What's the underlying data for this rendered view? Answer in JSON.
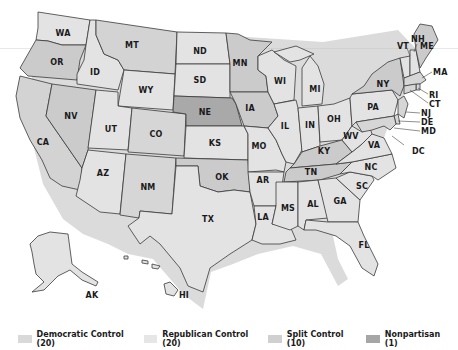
{
  "colors": {
    "democratic": "#d6d6d6",
    "republican": "#e3e3e3",
    "split": "#cfcfcf",
    "nonpartisan": "#a9a9a9",
    "dark_state": "#c4c4c4",
    "border": "#3a3a3a"
  },
  "legend": [
    {
      "label": "Democratic Control (20)",
      "color": "#d9d9d9"
    },
    {
      "label": "Republican Control (20)",
      "color": "#e6e6e6"
    },
    {
      "label": "Split Control (10)",
      "color": "#d0d0d0"
    },
    {
      "label": "Nonpartisan (1)",
      "color": "#a6a6a6"
    }
  ],
  "states": {
    "WA": "WA",
    "OR": "OR",
    "CA": "CA",
    "ID": "ID",
    "NV": "NV",
    "MT": "MT",
    "WY": "WY",
    "UT": "UT",
    "AZ": "AZ",
    "CO": "CO",
    "NM": "NM",
    "ND": "ND",
    "SD": "SD",
    "NE": "NE",
    "KS": "KS",
    "OK": "OK",
    "TX": "TX",
    "MN": "MN",
    "IA": "IA",
    "MO": "MO",
    "AR": "AR",
    "LA": "LA",
    "WI": "WI",
    "IL": "IL",
    "MI": "MI",
    "IN": "IN",
    "OH": "OH",
    "KY": "KY",
    "TN": "TN",
    "MS": "MS",
    "AL": "AL",
    "GA": "GA",
    "FL": "FL",
    "SC": "SC",
    "NC": "NC",
    "VA": "VA",
    "WV": "WV",
    "PA": "PA",
    "NY": "NY",
    "VT": "VT",
    "NH": "NH",
    "ME": "ME",
    "MA": "MA",
    "RI": "RI",
    "CT": "CT",
    "NJ": "NJ",
    "DE": "DE",
    "MD": "MD",
    "DC": "DC",
    "AK": "AK",
    "HI": "HI"
  }
}
